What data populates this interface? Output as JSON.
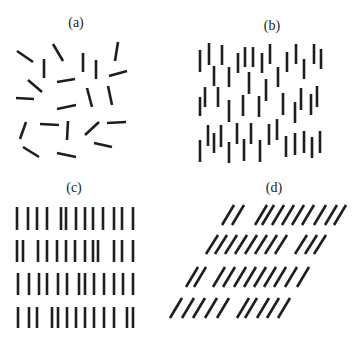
{
  "figure": {
    "width": 364,
    "height": 344,
    "line_color": "#1e1e1e",
    "background": "#ffffff",
    "panels": [
      {
        "id": "a",
        "label": "(a)",
        "label_pos": [
          76,
          22
        ],
        "description": "randomly oriented line segments",
        "segments": [
          [
            17,
            51,
            33,
            62
          ],
          [
            53,
            44,
            63,
            61
          ],
          [
            44,
            59,
            44,
            78
          ],
          [
            83,
            53,
            83,
            72
          ],
          [
            96,
            60,
            96,
            79
          ],
          [
            118,
            42,
            115,
            61
          ],
          [
            109,
            76,
            127,
            71
          ],
          [
            28,
            80,
            42,
            92
          ],
          [
            57,
            82,
            75,
            79
          ],
          [
            16,
            98,
            34,
            99
          ],
          [
            87,
            88,
            92,
            107
          ],
          [
            108,
            86,
            112,
            105
          ],
          [
            57,
            109,
            76,
            105
          ],
          [
            26,
            122,
            20,
            139
          ],
          [
            40,
            124,
            59,
            125
          ],
          [
            68,
            121,
            67,
            140
          ],
          [
            99,
            122,
            85,
            135
          ],
          [
            107,
            123,
            126,
            122
          ],
          [
            94,
            143,
            112,
            147
          ],
          [
            23,
            147,
            39,
            157
          ],
          [
            57,
            153,
            76,
            157
          ]
        ]
      },
      {
        "id": "b",
        "label": "(b)",
        "label_pos": [
          272,
          25
        ],
        "description": "vertical segments with jittered positions",
        "segments": [
          [
            200,
            50,
            200,
            72
          ],
          [
            209,
            43,
            209,
            65
          ],
          [
            222,
            45,
            222,
            65
          ],
          [
            238,
            53,
            238,
            73
          ],
          [
            245,
            47,
            245,
            67
          ],
          [
            253,
            47,
            253,
            67
          ],
          [
            262,
            53,
            262,
            73
          ],
          [
            270,
            44,
            270,
            64
          ],
          [
            287,
            52,
            287,
            72
          ],
          [
            296,
            44,
            296,
            64
          ],
          [
            304,
            59,
            304,
            79
          ],
          [
            314,
            44,
            314,
            64
          ],
          [
            321,
            49,
            321,
            69
          ],
          [
            214,
            66,
            214,
            86
          ],
          [
            229,
            67,
            229,
            87
          ],
          [
            249,
            72,
            249,
            94
          ],
          [
            266,
            79,
            266,
            101
          ],
          [
            278,
            67,
            278,
            87
          ],
          [
            205,
            87,
            205,
            107
          ],
          [
            200,
            97,
            200,
            116
          ],
          [
            218,
            87,
            218,
            107
          ],
          [
            229,
            100,
            229,
            122
          ],
          [
            243,
            95,
            243,
            116
          ],
          [
            259,
            96,
            259,
            117
          ],
          [
            283,
            93,
            283,
            115
          ],
          [
            295,
            102,
            295,
            123
          ],
          [
            301,
            88,
            301,
            110
          ],
          [
            311,
            94,
            311,
            115
          ],
          [
            317,
            86,
            317,
            107
          ],
          [
            208,
            125,
            208,
            146
          ],
          [
            200,
            140,
            200,
            162
          ],
          [
            214,
            133,
            214,
            153
          ],
          [
            221,
            125,
            221,
            147
          ],
          [
            229,
            142,
            229,
            163
          ],
          [
            237,
            123,
            237,
            144
          ],
          [
            244,
            139,
            244,
            161
          ],
          [
            251,
            123,
            251,
            144
          ],
          [
            260,
            140,
            260,
            162
          ],
          [
            269,
            124,
            269,
            145
          ],
          [
            277,
            119,
            277,
            140
          ],
          [
            286,
            136,
            286,
            157
          ],
          [
            295,
            133,
            295,
            155
          ],
          [
            304,
            131,
            304,
            153
          ],
          [
            312,
            137,
            312,
            158
          ],
          [
            320,
            131,
            320,
            153
          ]
        ]
      },
      {
        "id": "c",
        "label": "(c)",
        "label_pos": [
          74,
          187
        ],
        "description": "vertical segments aligned in rows",
        "rows": [
          {
            "y1": 207,
            "y2": 230,
            "xs": [
              17,
              28,
              37,
              47,
              61,
              66,
              76,
              85,
              93,
              103,
              114,
              122,
              133
            ]
          },
          {
            "y1": 240,
            "y2": 262,
            "xs": [
              17,
              23,
              38,
              47,
              57,
              66,
              75,
              85,
              93,
              98,
              114,
              122,
              133
            ]
          },
          {
            "y1": 273,
            "y2": 295,
            "xs": [
              18,
              29,
              39,
              47,
              58,
              67,
              79,
              85,
              94,
              104,
              114,
              123,
              133
            ]
          },
          {
            "y1": 307,
            "y2": 328,
            "xs": [
              18,
              29,
              37,
              52,
              58,
              67,
              76,
              85,
              94,
              104,
              114,
              127,
              133
            ]
          }
        ]
      },
      {
        "id": "d",
        "label": "(d)",
        "label_pos": [
          274,
          187
        ],
        "description": "oblique segments aligned in sheared rows",
        "rows": [
          {
            "y_bottom": 225,
            "y_top": 205,
            "dx": 12,
            "xs": [
              222,
              232,
              255,
              262,
              272,
              282,
              292,
              302,
              314,
              325,
              334
            ]
          },
          {
            "y_bottom": 254,
            "y_top": 235,
            "dx": 12,
            "xs": [
              206,
              215,
              225,
              235,
              245,
              255,
              265,
              275,
              295,
              305,
              314
            ]
          },
          {
            "y_bottom": 287,
            "y_top": 267,
            "dx": 12,
            "xs": [
              186,
              194,
              213,
              223,
              234,
              244,
              254,
              264,
              274,
              285,
              297
            ]
          },
          {
            "y_bottom": 318,
            "y_top": 298,
            "dx": 12,
            "xs": [
              170,
              182,
              193,
              205,
              217,
              237,
              245,
              257,
              267,
              278
            ]
          }
        ]
      }
    ]
  }
}
